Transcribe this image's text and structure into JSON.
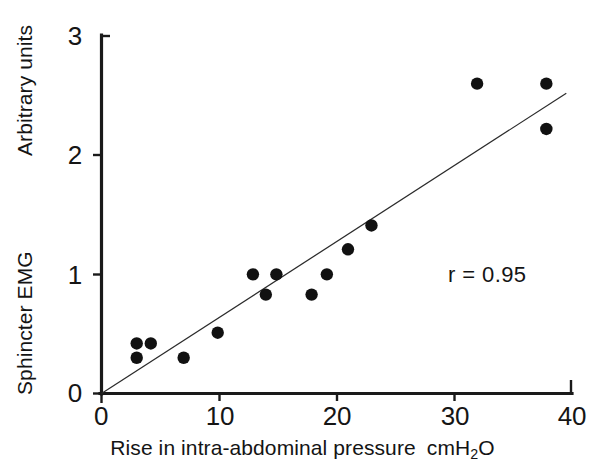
{
  "chart_data": {
    "type": "scatter",
    "title": "",
    "xlabel": "Rise in intra-abdominal pressure  cmH2O",
    "xlabel_main": "Rise in intra-abdominal pressure",
    "xlabel_unit_pre": "cmH",
    "xlabel_unit_sub": "2",
    "xlabel_unit_post": "O",
    "ylabel_upper": "Arbitrary units",
    "ylabel_lower": "Sphincter EMG",
    "xlim": [
      0,
      40
    ],
    "ylim": [
      0,
      3
    ],
    "xticks": [
      0,
      10,
      20,
      30,
      40
    ],
    "xtick_labels": [
      "0",
      "10",
      "20",
      "30",
      "40"
    ],
    "yticks": [
      0,
      1,
      2,
      3
    ],
    "ytick_labels": [
      "0",
      "1",
      "2",
      "3"
    ],
    "grid": false,
    "legend": null,
    "annotations": [
      {
        "text": "r = 0.95",
        "x": 34.0,
        "y": 0.98
      }
    ],
    "correlation_label": "r = 0.95",
    "correlation_value": 0.95,
    "points": [
      {
        "x": 3.0,
        "y": 0.42
      },
      {
        "x": 4.2,
        "y": 0.42
      },
      {
        "x": 3.0,
        "y": 0.3
      },
      {
        "x": 7.0,
        "y": 0.3
      },
      {
        "x": 9.9,
        "y": 0.51
      },
      {
        "x": 12.9,
        "y": 1.0
      },
      {
        "x": 14.0,
        "y": 0.83
      },
      {
        "x": 14.9,
        "y": 1.0
      },
      {
        "x": 17.9,
        "y": 0.83
      },
      {
        "x": 19.2,
        "y": 1.0
      },
      {
        "x": 21.0,
        "y": 1.21
      },
      {
        "x": 23.0,
        "y": 1.41
      },
      {
        "x": 32.0,
        "y": 2.6
      },
      {
        "x": 37.9,
        "y": 2.6
      },
      {
        "x": 37.9,
        "y": 2.22
      }
    ],
    "fit_line": {
      "x0": 0.0,
      "y0": 0.0,
      "x1": 39.6,
      "y1": 2.52
    }
  }
}
